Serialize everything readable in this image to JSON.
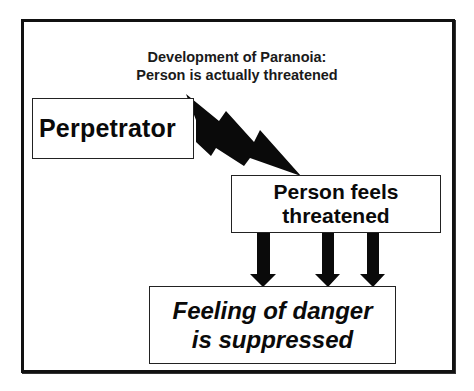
{
  "diagram": {
    "title_line1": "Development of Paranoia:",
    "title_line2": "Person is actually threatened",
    "nodes": [
      {
        "id": "perpetrator",
        "label": "Perpetrator"
      },
      {
        "id": "person-feels",
        "label_line1": "Person feels",
        "label_line2": "threatened"
      },
      {
        "id": "danger-suppressed",
        "label_line1": "Feeling of danger",
        "label_line2": "is suppressed"
      }
    ],
    "edges": [
      {
        "from": "perpetrator",
        "to": "person-feels",
        "style": "lightning-bolt"
      },
      {
        "from": "person-feels",
        "to": "danger-suppressed",
        "style": "triple-down-arrow",
        "count": 3
      }
    ],
    "colors": {
      "stroke": "#111111",
      "background": "#ffffff"
    }
  }
}
